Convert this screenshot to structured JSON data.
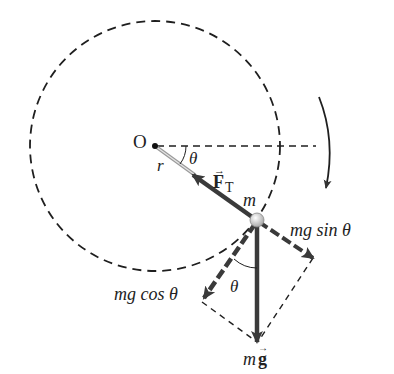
{
  "diagram": {
    "type": "free-body diagram",
    "labels": {
      "origin": "O",
      "radius": "r",
      "angle_top": "θ",
      "tension_main": "F",
      "tension_sub": "T",
      "mass": "m",
      "sin_component": "mg sin θ",
      "cos_component": "mg cos θ",
      "angle_bottom": "θ",
      "weight_m": "m",
      "weight_g": "g"
    },
    "colors": {
      "line": "#1f1f1f",
      "force": "#3a3a3a",
      "rod": "#b8b8b8",
      "ball": "#d8d8d8",
      "background": "#ffffff"
    },
    "rotation_direction": "clockwise"
  }
}
